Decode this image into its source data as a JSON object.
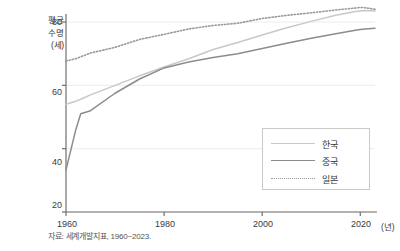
{
  "chart_data": {
    "type": "line",
    "title": "",
    "subtitle": "",
    "ylabel_lines": [
      "평균",
      "수명",
      "(세)"
    ],
    "ylabel": "평균 수명 (세)",
    "xlabel": "(년)",
    "xunit": "(년)",
    "xlim": [
      1960,
      2023
    ],
    "ylim": [
      18,
      88
    ],
    "yticks": [
      20,
      40,
      60,
      80
    ],
    "ytick_labels": [
      "20",
      "40",
      "60",
      "80"
    ],
    "xticks": [
      1960,
      1980,
      2000,
      2020
    ],
    "xtick_labels": [
      "1960",
      "1980",
      "2000",
      "2020"
    ],
    "grid": "horizontal",
    "legend_position": "bottom-right",
    "x": [
      1960,
      1962,
      1963,
      1965,
      1970,
      1975,
      1980,
      1985,
      1990,
      1995,
      2000,
      2005,
      2010,
      2015,
      2019,
      2020,
      2021,
      2023
    ],
    "series": [
      {
        "name": "한국",
        "label": "한국",
        "color": "#c8c8c8",
        "style": "solid",
        "values": [
          54.0,
          55.0,
          55.6,
          57.0,
          60.0,
          63.0,
          65.8,
          68.4,
          71.3,
          73.5,
          75.9,
          78.2,
          80.2,
          82.1,
          83.3,
          83.5,
          83.6,
          83.5
        ]
      },
      {
        "name": "중국",
        "label": "중국",
        "color": "#8c8c8c",
        "style": "solid",
        "values": [
          33.3,
          46.0,
          51.0,
          52.0,
          57.5,
          62.0,
          65.5,
          67.4,
          68.8,
          70.0,
          71.6,
          73.3,
          74.9,
          76.3,
          77.4,
          77.6,
          77.8,
          78.0
        ]
      },
      {
        "name": "일본",
        "label": "일본",
        "color": "#9a9a9a",
        "style": "dotted",
        "values": [
          67.7,
          68.4,
          69.0,
          70.2,
          72.0,
          74.5,
          76.1,
          77.8,
          78.9,
          79.6,
          81.1,
          82.1,
          82.9,
          83.8,
          84.4,
          84.6,
          84.5,
          84.0
        ]
      }
    ]
  },
  "axis": {
    "ylabel_lines": [
      "평균",
      "수명",
      "(세)"
    ],
    "xunit": "(년)",
    "yticks": [
      "20",
      "40",
      "60",
      "80"
    ],
    "xticks": [
      "1960",
      "1980",
      "2000",
      "2020"
    ]
  },
  "legend": {
    "items": [
      {
        "label": "한국"
      },
      {
        "label": "중국"
      },
      {
        "label": "일본"
      }
    ]
  },
  "footer": {
    "source": "자료: 세계개발지표, 1960~2023."
  },
  "colors": {
    "korea": "#c8c8c8",
    "china": "#8c8c8c",
    "japan": "#9a9a9a",
    "axis": "#6f6f6f",
    "grid": "#ececec"
  }
}
